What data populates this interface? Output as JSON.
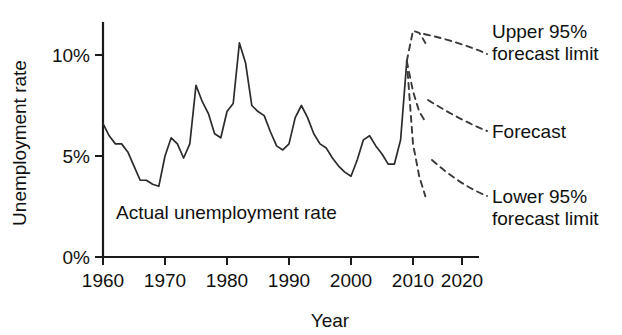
{
  "chart_data": {
    "type": "line",
    "title": "",
    "xlabel": "Year",
    "ylabel": "Unemployment rate",
    "xlim": [
      1960,
      2022
    ],
    "ylim": [
      0,
      11.5
    ],
    "grid": false,
    "legend_position": "annotations-right",
    "x_ticks": [
      "1960",
      "1970",
      "1980",
      "1990",
      "2000",
      "2010",
      "2020"
    ],
    "x_tick_values": [
      1960,
      1970,
      1980,
      1990,
      2000,
      2010,
      2020
    ],
    "y_ticks": [
      "0%",
      "5%",
      "10%"
    ],
    "y_tick_values": [
      0,
      5,
      10
    ],
    "annotations": [
      {
        "key": "actual",
        "text": "Actual unemployment rate"
      },
      {
        "key": "upper",
        "line1": "Upper 95%",
        "line2": "forecast limit"
      },
      {
        "key": "forecast",
        "line1": "Forecast",
        "line2": ""
      },
      {
        "key": "lower",
        "line1": "Lower 95%",
        "line2": "forecast limit"
      }
    ],
    "series": [
      {
        "name": "Actual unemployment rate",
        "style": "solid",
        "x": [
          1960,
          1961,
          1962,
          1963,
          1964,
          1965,
          1966,
          1967,
          1968,
          1969,
          1970,
          1971,
          1972,
          1973,
          1974,
          1975,
          1976,
          1977,
          1978,
          1979,
          1980,
          1981,
          1982,
          1983,
          1984,
          1985,
          1986,
          1987,
          1988,
          1989,
          1990,
          1991,
          1992,
          1993,
          1994,
          1995,
          1996,
          1997,
          1998,
          1999,
          2000,
          2001,
          2002,
          2003,
          2004,
          2005,
          2006,
          2007,
          2008,
          2009
        ],
        "values": [
          6.6,
          6.0,
          5.6,
          5.6,
          5.2,
          4.5,
          3.8,
          3.8,
          3.6,
          3.5,
          5.0,
          5.9,
          5.6,
          4.9,
          5.6,
          8.5,
          7.7,
          7.1,
          6.1,
          5.9,
          7.2,
          7.6,
          10.6,
          9.6,
          7.5,
          7.2,
          7.0,
          6.2,
          5.5,
          5.3,
          5.6,
          6.9,
          7.5,
          6.9,
          6.1,
          5.6,
          5.4,
          4.9,
          4.5,
          4.2,
          4.0,
          4.8,
          5.8,
          6.0,
          5.5,
          5.1,
          4.6,
          4.6,
          5.8,
          9.7
        ]
      },
      {
        "name": "Upper 95% forecast limit",
        "style": "dashed",
        "x": [
          2009,
          2010,
          2011,
          2012
        ],
        "values": [
          9.7,
          11.2,
          11.1,
          10.6
        ]
      },
      {
        "name": "Forecast",
        "style": "dashed",
        "x": [
          2009,
          2010,
          2011,
          2012
        ],
        "values": [
          9.7,
          8.2,
          7.2,
          6.7
        ]
      },
      {
        "name": "Lower 95% forecast limit",
        "style": "dashed",
        "x": [
          2009,
          2010,
          2011,
          2012
        ],
        "values": [
          9.7,
          5.6,
          4.0,
          3.0
        ]
      }
    ]
  },
  "axes": {
    "y_label": "Unemployment rate",
    "x_label": "Year",
    "y_tick_0": "0%",
    "y_tick_5": "5%",
    "y_tick_10": "10%",
    "x_tick_1960": "1960",
    "x_tick_1970": "1970",
    "x_tick_1980": "1980",
    "x_tick_1990": "1990",
    "x_tick_2000": "2000",
    "x_tick_2010": "2010",
    "x_tick_2020": "2020"
  },
  "labels": {
    "actual": "Actual unemployment rate",
    "upper_l1": "Upper 95%",
    "upper_l2": "forecast limit",
    "forecast": "Forecast",
    "lower_l1": "Lower 95%",
    "lower_l2": "forecast limit"
  },
  "colors": {
    "axis": "#1a1a1a",
    "actual_line": "#2b2b2b",
    "forecast_line": "#3a3a3a",
    "background": "#ffffff",
    "text": "#111111"
  }
}
